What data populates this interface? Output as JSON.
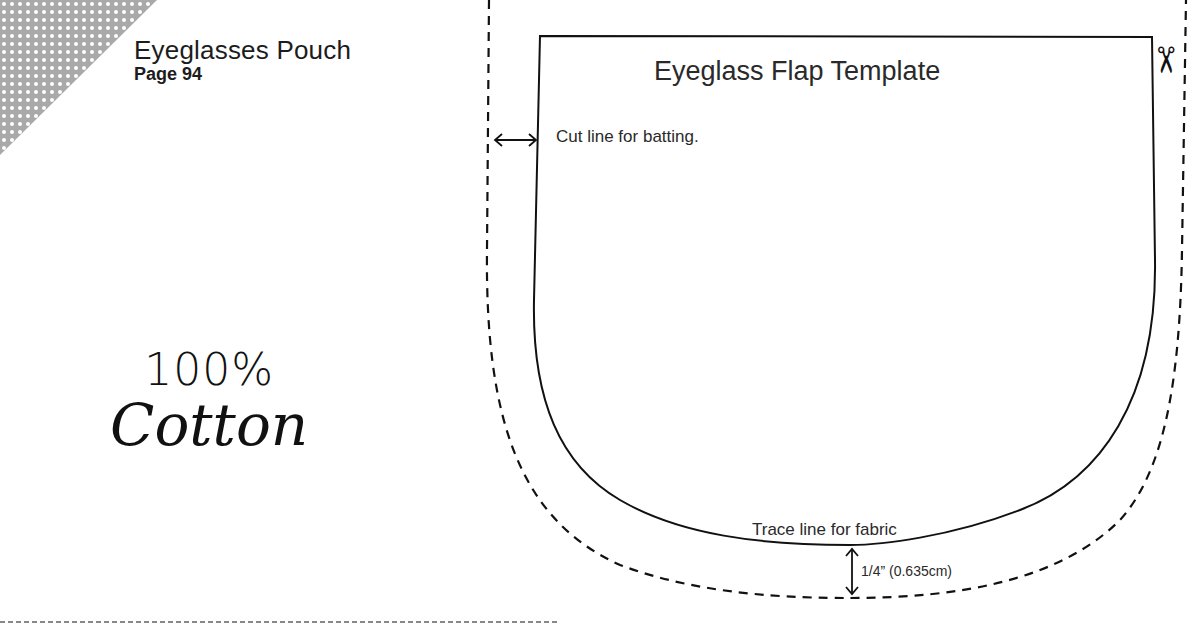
{
  "header": {
    "title": "Eyeglasses Pouch",
    "page": "Page 94"
  },
  "fabric_note": {
    "line1": "100%",
    "line2": "Cotton"
  },
  "template": {
    "title": "Eyeglass Flap Template",
    "cut_line_label": "Cut line for batting.",
    "trace_line_label": "Trace line for fabric",
    "seam_allowance_label": "1/4” (0.635cm)",
    "scissors_icon": "✂"
  },
  "colors": {
    "ink": "#1a1a1a",
    "corner_pattern": "#a9a9a9"
  }
}
